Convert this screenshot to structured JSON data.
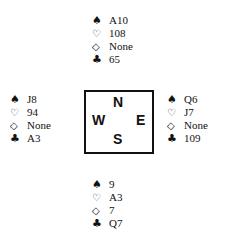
{
  "suits": {
    "spades": "♠",
    "hearts": "♡",
    "diamonds": "◇",
    "clubs": "♣"
  },
  "hands": {
    "north": {
      "spades": "A10",
      "hearts": "108",
      "diamonds": "None",
      "clubs": "65"
    },
    "west": {
      "spades": "J8",
      "hearts": "94",
      "diamonds": "None",
      "clubs": "A3"
    },
    "east": {
      "spades": "Q6",
      "hearts": "J7",
      "diamonds": "None",
      "clubs": "109"
    },
    "south": {
      "spades": "9",
      "hearts": "A3",
      "diamonds": "7",
      "clubs": "Q7"
    }
  },
  "compass": {
    "north": "N",
    "west": "W",
    "east": "E",
    "south": "S"
  }
}
